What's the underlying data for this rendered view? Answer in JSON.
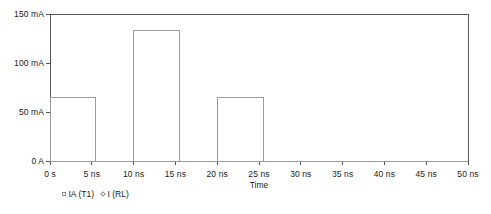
{
  "chart_data": {
    "type": "line",
    "title": "",
    "xlabel": "Time",
    "ylabel": "",
    "xlim": [
      0,
      50
    ],
    "ylim": [
      0,
      150
    ],
    "grid": false,
    "legend_position": "bottom-left",
    "x_unit": "ns",
    "y_unit": "mA",
    "xticks": [
      0,
      5,
      10,
      15,
      20,
      25,
      30,
      35,
      40,
      45,
      50
    ],
    "xtick_labels": [
      "0 s",
      "5 ns",
      "10 ns",
      "15 ns",
      "20 ns",
      "25 ns",
      "30 ns",
      "35 ns",
      "40 ns",
      "45 ns",
      "50 ns"
    ],
    "yticks": [
      0,
      50,
      100,
      150
    ],
    "ytick_labels": [
      "0 A",
      "50 mA",
      "100 mA",
      "150 mA"
    ],
    "series": [
      {
        "name": "IA (T1)",
        "marker": "square",
        "color": "#9a9a9a",
        "x": [
          0,
          0,
          5.5,
          5.5,
          10,
          10,
          15.5,
          15.5,
          20,
          20,
          25.5,
          25.5,
          50
        ],
        "values": [
          0,
          65,
          65,
          0,
          0,
          133,
          133,
          0,
          0,
          65,
          65,
          0,
          0
        ]
      },
      {
        "name": "I (RL)",
        "marker": "diamond",
        "color": "#9a9a9a",
        "x": [
          0,
          50
        ],
        "values": [
          0,
          0
        ]
      }
    ],
    "pulses": [
      {
        "start_ns": 0,
        "end_ns": 5.5,
        "amplitude_ma": 65
      },
      {
        "start_ns": 10,
        "end_ns": 15.5,
        "amplitude_ma": 133
      },
      {
        "start_ns": 20,
        "end_ns": 25.5,
        "amplitude_ma": 65
      }
    ]
  },
  "legend": {
    "entries": [
      {
        "label": "IA (T1)",
        "marker": "square"
      },
      {
        "label": "I (RL)",
        "marker": "diamond"
      }
    ]
  },
  "axes": {
    "x_title": "Time"
  },
  "colors": {
    "frame": "#555555",
    "trace": "#9a9a9a",
    "text": "#1a1a1a",
    "background": "#ffffff"
  }
}
